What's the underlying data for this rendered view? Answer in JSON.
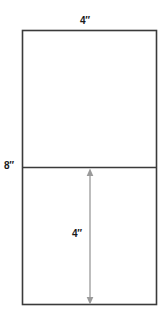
{
  "diagram": {
    "kind": "geometry-figure",
    "shape": {
      "name": "rectangle",
      "width_label": "4″",
      "height_label": "8″",
      "divider": {
        "name": "horizontal-divider-line",
        "position_fraction": 0.5
      },
      "outline_color": "#3a3a3a",
      "fill_color": "#ffffff"
    },
    "labels": {
      "top": "4″",
      "left": "8″",
      "inner": "4″"
    },
    "arrow": {
      "name": "vertical-dimension-arrow",
      "label": "4″",
      "color": "#9a9a9a",
      "double_headed": true,
      "orientation": "vertical",
      "spans": "lower-half"
    }
  },
  "geometry": {
    "rect_left": 22,
    "rect_right": 157,
    "rect_top": 30,
    "rect_bottom": 305,
    "divider_y": 167,
    "arrow_x": 90,
    "arrow_top": 169,
    "arrow_bottom": 304
  }
}
